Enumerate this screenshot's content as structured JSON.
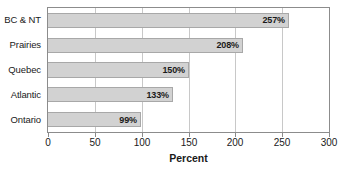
{
  "chart_data": {
    "type": "bar",
    "orientation": "horizontal",
    "title": "",
    "subtitle": "",
    "xlabel": "Percent",
    "ylabel": "",
    "categories": [
      "BC & NT",
      "Prairies",
      "Quebec",
      "Atlantic",
      "Ontario"
    ],
    "values": [
      257,
      208,
      150,
      133,
      99
    ],
    "data_labels": [
      "257%",
      "208%",
      "150%",
      "133%",
      "99%"
    ],
    "xlim": [
      0,
      300
    ],
    "xticks": [
      0,
      50,
      100,
      150,
      200,
      250,
      300
    ],
    "xtick_labels": [
      "0",
      "50",
      "100",
      "150",
      "200",
      "250",
      "300"
    ],
    "grid": "vertical",
    "legend": "none",
    "series": [
      {
        "name": "Percent",
        "values": [
          257,
          208,
          150,
          133,
          99
        ]
      }
    ],
    "colors": {
      "bar_fill": "#d2d2d2",
      "bar_border": "#a8a8a8",
      "gridline": "#c8c8c8",
      "axis": "#8c8c8c",
      "text": "#1a1a1a"
    }
  }
}
